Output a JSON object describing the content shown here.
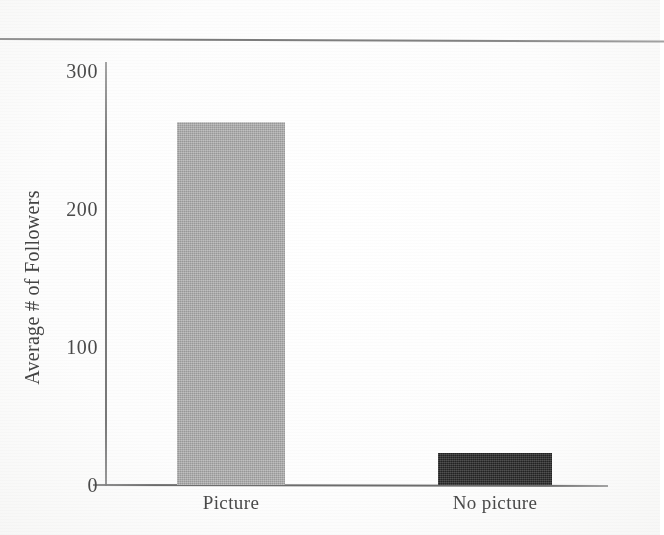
{
  "page": {
    "rule_present": true
  },
  "chart_data": {
    "type": "bar",
    "title": "",
    "xlabel": "",
    "ylabel": "Average # of Followers",
    "categories": [
      "Picture",
      "No picture"
    ],
    "values": [
      263,
      23
    ],
    "ylim": [
      0,
      300
    ],
    "yticks": [
      0,
      100,
      200,
      300
    ],
    "ytick_labels": [
      "0",
      "100",
      "200",
      "300"
    ],
    "grid": false,
    "legend": false,
    "legend_position": "none",
    "bar_colors": [
      "#a9a9a9",
      "#2e2e2e"
    ],
    "axis_color": "#5f5f5f",
    "annotations": []
  }
}
